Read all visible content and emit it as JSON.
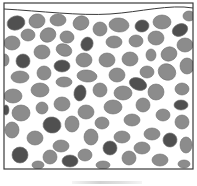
{
  "figure": {
    "colors": {
      "background": "#ffffff",
      "border": "#3a3a3a",
      "particle_light": "#8c8c8c",
      "particle_dark": "#505050",
      "particle_edge": "#6e6e6e"
    },
    "container": {
      "x": 4,
      "y": 3,
      "width": 189,
      "height": 166
    },
    "surface_line": "M4,9 C40,11 80,16 110,14 C140,12 170,4 193,8",
    "caption": "",
    "particles": [
      {
        "cx": 16,
        "cy": 23,
        "rx": 9,
        "ry": 7,
        "rot": -15,
        "dark": true
      },
      {
        "cx": 37,
        "cy": 21,
        "rx": 8,
        "ry": 7,
        "rot": -10,
        "dark": false
      },
      {
        "cx": 58,
        "cy": 20,
        "rx": 8,
        "ry": 6,
        "rot": 0,
        "dark": false
      },
      {
        "cx": 81,
        "cy": 23,
        "rx": 8,
        "ry": 7,
        "rot": -20,
        "dark": false
      },
      {
        "cx": 100,
        "cy": 29,
        "rx": 7,
        "ry": 7,
        "rot": 0,
        "dark": false
      },
      {
        "cx": 119,
        "cy": 25,
        "rx": 10,
        "ry": 7,
        "rot": 5,
        "dark": false
      },
      {
        "cx": 142,
        "cy": 26,
        "rx": 7,
        "ry": 6,
        "rot": -10,
        "dark": true
      },
      {
        "cx": 162,
        "cy": 22,
        "rx": 9,
        "ry": 7,
        "rot": 0,
        "dark": false
      },
      {
        "cx": 180,
        "cy": 30,
        "rx": 8,
        "ry": 6,
        "rot": -25,
        "dark": true
      },
      {
        "cx": 189,
        "cy": 16,
        "rx": 6,
        "ry": 5,
        "rot": 0,
        "dark": false
      },
      {
        "cx": 28,
        "cy": 35,
        "rx": 7,
        "ry": 6,
        "rot": 0,
        "dark": false
      },
      {
        "cx": 48,
        "cy": 35,
        "rx": 8,
        "ry": 7,
        "rot": -25,
        "dark": false
      },
      {
        "cx": 67,
        "cy": 37,
        "rx": 7,
        "ry": 6,
        "rot": 10,
        "dark": false
      },
      {
        "cx": 87,
        "cy": 44,
        "rx": 6,
        "ry": 7,
        "rot": 20,
        "dark": true
      },
      {
        "cx": 114,
        "cy": 42,
        "rx": 8,
        "ry": 6,
        "rot": 0,
        "dark": false
      },
      {
        "cx": 136,
        "cy": 41,
        "rx": 7,
        "ry": 6,
        "rot": 0,
        "dark": false
      },
      {
        "cx": 156,
        "cy": 38,
        "rx": 8,
        "ry": 7,
        "rot": 0,
        "dark": false
      },
      {
        "cx": 12,
        "cy": 43,
        "rx": 8,
        "ry": 7,
        "rot": 0,
        "dark": false
      },
      {
        "cx": 185,
        "cy": 45,
        "rx": 8,
        "ry": 7,
        "rot": 0,
        "dark": false
      },
      {
        "cx": 42,
        "cy": 52,
        "rx": 8,
        "ry": 7,
        "rot": 0,
        "dark": false
      },
      {
        "cx": 64,
        "cy": 50,
        "rx": 8,
        "ry": 6,
        "rot": 20,
        "dark": false
      },
      {
        "cx": 23,
        "cy": 61,
        "rx": 7,
        "ry": 7,
        "rot": 0,
        "dark": true
      },
      {
        "cx": 62,
        "cy": 66,
        "rx": 8,
        "ry": 6,
        "rot": 0,
        "dark": true
      },
      {
        "cx": 84,
        "cy": 60,
        "rx": 8,
        "ry": 7,
        "rot": 0,
        "dark": false
      },
      {
        "cx": 107,
        "cy": 60,
        "rx": 8,
        "ry": 7,
        "rot": 0,
        "dark": false
      },
      {
        "cx": 130,
        "cy": 59,
        "rx": 8,
        "ry": 7,
        "rot": 0,
        "dark": false
      },
      {
        "cx": 151,
        "cy": 55,
        "rx": 5,
        "ry": 6,
        "rot": 0,
        "dark": false
      },
      {
        "cx": 169,
        "cy": 54,
        "rx": 8,
        "ry": 7,
        "rot": -20,
        "dark": false
      },
      {
        "cx": 187,
        "cy": 66,
        "rx": 7,
        "ry": 8,
        "rot": 0,
        "dark": false
      },
      {
        "cx": 5,
        "cy": 60,
        "rx": 4,
        "ry": 6,
        "rot": 0,
        "dark": false
      },
      {
        "cx": 44,
        "cy": 73,
        "rx": 7,
        "ry": 7,
        "rot": 0,
        "dark": false
      },
      {
        "cx": 20,
        "cy": 77,
        "rx": 9,
        "ry": 6,
        "rot": 0,
        "dark": false
      },
      {
        "cx": 87,
        "cy": 76,
        "rx": 10,
        "ry": 6,
        "rot": 5,
        "dark": false
      },
      {
        "cx": 117,
        "cy": 75,
        "rx": 8,
        "ry": 7,
        "rot": 0,
        "dark": false
      },
      {
        "cx": 147,
        "cy": 72,
        "rx": 7,
        "ry": 6,
        "rot": 0,
        "dark": false
      },
      {
        "cx": 167,
        "cy": 72,
        "rx": 9,
        "ry": 8,
        "rot": 30,
        "dark": false
      },
      {
        "cx": 64,
        "cy": 82,
        "rx": 8,
        "ry": 5,
        "rot": 0,
        "dark": false
      },
      {
        "cx": 138,
        "cy": 84,
        "rx": 9,
        "ry": 6,
        "rot": 20,
        "dark": true
      },
      {
        "cx": 40,
        "cy": 90,
        "rx": 9,
        "ry": 7,
        "rot": 0,
        "dark": false
      },
      {
        "cx": 13,
        "cy": 96,
        "rx": 9,
        "ry": 7,
        "rot": 0,
        "dark": false
      },
      {
        "cx": 80,
        "cy": 93,
        "rx": 6,
        "ry": 8,
        "rot": 10,
        "dark": true
      },
      {
        "cx": 100,
        "cy": 90,
        "rx": 7,
        "ry": 7,
        "rot": 0,
        "dark": false
      },
      {
        "cx": 123,
        "cy": 93,
        "rx": 9,
        "ry": 7,
        "rot": 0,
        "dark": false
      },
      {
        "cx": 156,
        "cy": 92,
        "rx": 8,
        "ry": 8,
        "rot": 0,
        "dark": false
      },
      {
        "cx": 182,
        "cy": 89,
        "rx": 7,
        "ry": 6,
        "rot": 0,
        "dark": false
      },
      {
        "cx": 62,
        "cy": 104,
        "rx": 8,
        "ry": 7,
        "rot": 0,
        "dark": false
      },
      {
        "cx": 42,
        "cy": 108,
        "rx": 6,
        "ry": 6,
        "rot": 0,
        "dark": false
      },
      {
        "cx": 181,
        "cy": 105,
        "rx": 7,
        "ry": 5,
        "rot": 0,
        "dark": true
      },
      {
        "cx": 143,
        "cy": 105,
        "rx": 7,
        "ry": 7,
        "rot": 0,
        "dark": false
      },
      {
        "cx": 113,
        "cy": 107,
        "rx": 9,
        "ry": 7,
        "rot": 0,
        "dark": false
      },
      {
        "cx": 86,
        "cy": 112,
        "rx": 8,
        "ry": 7,
        "rot": 0,
        "dark": false
      },
      {
        "cx": 6,
        "cy": 110,
        "rx": 3,
        "ry": 5,
        "rot": 0,
        "dark": true
      },
      {
        "cx": 21,
        "cy": 113,
        "rx": 9,
        "ry": 8,
        "rot": 0,
        "dark": false
      },
      {
        "cx": 163,
        "cy": 115,
        "rx": 7,
        "ry": 6,
        "rot": 0,
        "dark": false
      },
      {
        "cx": 52,
        "cy": 125,
        "rx": 9,
        "ry": 8,
        "rot": 10,
        "dark": true
      },
      {
        "cx": 72,
        "cy": 124,
        "rx": 7,
        "ry": 8,
        "rot": 0,
        "dark": false
      },
      {
        "cx": 102,
        "cy": 123,
        "rx": 7,
        "ry": 6,
        "rot": 0,
        "dark": false
      },
      {
        "cx": 132,
        "cy": 120,
        "rx": 8,
        "ry": 6,
        "rot": 0,
        "dark": false
      },
      {
        "cx": 182,
        "cy": 122,
        "rx": 7,
        "ry": 7,
        "rot": 0,
        "dark": false
      },
      {
        "cx": 12,
        "cy": 130,
        "rx": 7,
        "ry": 8,
        "rot": 0,
        "dark": false
      },
      {
        "cx": 35,
        "cy": 138,
        "rx": 8,
        "ry": 7,
        "rot": 0,
        "dark": false
      },
      {
        "cx": 91,
        "cy": 137,
        "rx": 7,
        "ry": 8,
        "rot": 0,
        "dark": false
      },
      {
        "cx": 122,
        "cy": 137,
        "rx": 8,
        "ry": 6,
        "rot": 0,
        "dark": false
      },
      {
        "cx": 152,
        "cy": 134,
        "rx": 8,
        "ry": 6,
        "rot": 0,
        "dark": false
      },
      {
        "cx": 170,
        "cy": 140,
        "rx": 7,
        "ry": 7,
        "rot": 15,
        "dark": true
      },
      {
        "cx": 61,
        "cy": 146,
        "rx": 8,
        "ry": 6,
        "rot": 0,
        "dark": false
      },
      {
        "cx": 110,
        "cy": 148,
        "rx": 7,
        "ry": 7,
        "rot": 0,
        "dark": true
      },
      {
        "cx": 142,
        "cy": 148,
        "rx": 8,
        "ry": 6,
        "rot": 0,
        "dark": false
      },
      {
        "cx": 186,
        "cy": 145,
        "rx": 6,
        "ry": 8,
        "rot": 0,
        "dark": false
      },
      {
        "cx": 20,
        "cy": 155,
        "rx": 8,
        "ry": 8,
        "rot": 0,
        "dark": true
      },
      {
        "cx": 50,
        "cy": 157,
        "rx": 7,
        "ry": 7,
        "rot": 0,
        "dark": false
      },
      {
        "cx": 85,
        "cy": 155,
        "rx": 7,
        "ry": 6,
        "rot": 0,
        "dark": false
      },
      {
        "cx": 129,
        "cy": 158,
        "rx": 7,
        "ry": 7,
        "rot": 0,
        "dark": false
      },
      {
        "cx": 160,
        "cy": 160,
        "rx": 8,
        "ry": 6,
        "rot": 0,
        "dark": false
      },
      {
        "cx": 70,
        "cy": 161,
        "rx": 8,
        "ry": 6,
        "rot": 0,
        "dark": true
      },
      {
        "cx": 38,
        "cy": 165,
        "rx": 6,
        "ry": 4,
        "rot": 0,
        "dark": false
      },
      {
        "cx": 103,
        "cy": 165,
        "rx": 7,
        "ry": 4,
        "rot": 0,
        "dark": false
      },
      {
        "cx": 184,
        "cy": 164,
        "rx": 6,
        "ry": 4,
        "rot": 0,
        "dark": false
      }
    ]
  }
}
